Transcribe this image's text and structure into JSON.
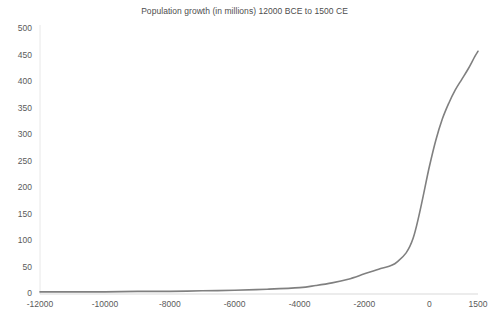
{
  "chart_data": {
    "type": "line",
    "title": "Population growth (in millions) 12000 BCE to 1500 CE",
    "xlabel": "",
    "ylabel": "",
    "xlim": [
      -12000,
      1500
    ],
    "ylim": [
      0,
      500
    ],
    "grid": false,
    "legend": "none",
    "line_color": "#808080",
    "text_color": "#595959",
    "background_color": "#ffffff",
    "xticks": [
      -12000,
      -10000,
      -8000,
      -6000,
      -4000,
      -2000,
      0,
      1500
    ],
    "xtick_labels": [
      "-12000",
      "-10000",
      "-8000",
      "-6000",
      "-4000",
      "-2000",
      "0",
      "1500"
    ],
    "yticks": [
      0,
      50,
      100,
      150,
      200,
      250,
      300,
      350,
      400,
      450,
      500
    ],
    "ytick_labels": [
      "0",
      "50",
      "100",
      "150",
      "200",
      "250",
      "300",
      "350",
      "400",
      "450",
      "500"
    ],
    "series": [
      {
        "name": "Population (millions)",
        "x": [
          -12000,
          -11000,
          -10000,
          -9000,
          -8000,
          -7000,
          -6000,
          -5000,
          -4000,
          -3500,
          -3000,
          -2500,
          -2000,
          -1500,
          -1000,
          -500,
          0,
          200,
          400,
          600,
          800,
          1000,
          1200,
          1400,
          1500
        ],
        "y": [
          4,
          4,
          4,
          5,
          5,
          6,
          7,
          9,
          12,
          16,
          21,
          28,
          38,
          48,
          60,
          105,
          240,
          290,
          330,
          360,
          385,
          405,
          425,
          448,
          458
        ]
      }
    ]
  }
}
